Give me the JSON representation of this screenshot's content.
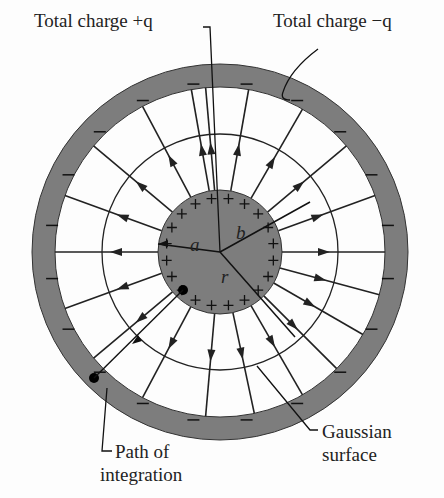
{
  "labels": {
    "inner_charge": "Total charge +q",
    "outer_charge": "Total charge −q",
    "path_line1": "Path of",
    "path_line2": "integration",
    "gauss_line1": "Gaussian",
    "gauss_line2": "surface",
    "radius_a": "a",
    "radius_b": "b",
    "radius_r": "r"
  },
  "geometry": {
    "center": [
      220,
      252
    ],
    "inner_sphere_radius": 62,
    "shell_inner_radius": 165,
    "shell_outer_radius": 188,
    "gaussian_radius": 118
  },
  "colors": {
    "conductor": "#7d7d7d",
    "line": "#222222",
    "background": "#fdfdfd"
  },
  "field_line_angles_deg": [
    95,
    80,
    60,
    40,
    20,
    0,
    -15,
    -30,
    -45,
    -60,
    -78,
    -95,
    -118,
    -140,
    -160,
    180,
    160,
    140,
    118,
    100
  ],
  "plus_count": 20,
  "minus_count": 20
}
